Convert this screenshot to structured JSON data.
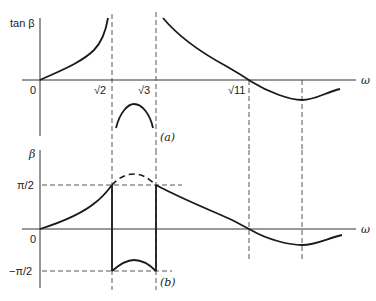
{
  "figure": {
    "panel_a": {
      "label": "(a)",
      "y_axis_label": "tan β",
      "x_axis_label": "ω",
      "origin_label": "0",
      "x_ticks": [
        "√2",
        "√3",
        "√11"
      ]
    },
    "panel_b": {
      "label": "(b)",
      "y_axis_label": "β",
      "x_axis_label": "ω",
      "origin_label": "0",
      "y_ticks": [
        "π/2",
        "−π/2"
      ]
    }
  },
  "colors": {
    "ink": "#1a1a1a",
    "background": "#ffffff"
  }
}
